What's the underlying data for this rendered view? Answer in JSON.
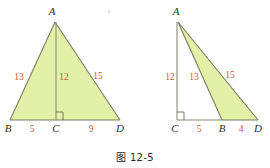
{
  "figure": {
    "caption": "图 12-5",
    "colors": {
      "shade_fill": "#e3f0a8",
      "edge_stroke": "#7d7a60",
      "length_text": "#d4562a",
      "vertex_text": "#2e2e2e",
      "background": "#ffffff"
    },
    "panels": [
      {
        "id": "left-panel",
        "name": "acute-triangle-with-altitude",
        "shaded_region": "ABD",
        "vertices": [
          {
            "label": "A",
            "name": "vertex-a"
          },
          {
            "label": "B",
            "name": "vertex-b"
          },
          {
            "label": "C",
            "name": "vertex-c"
          },
          {
            "label": "D",
            "name": "vertex-d"
          }
        ],
        "segments": [
          {
            "name": "segment-ab",
            "label": "13"
          },
          {
            "name": "segment-ac",
            "label": "12"
          },
          {
            "name": "segment-ad",
            "label": "15"
          },
          {
            "name": "segment-bc",
            "label": "5"
          },
          {
            "name": "segment-cd",
            "label": "9"
          }
        ],
        "right_angle_at": "C"
      },
      {
        "id": "right-panel",
        "name": "obtuse-triangle-with-external-altitude",
        "shaded_region": "ABD",
        "vertices": [
          {
            "label": "A",
            "name": "vertex-a"
          },
          {
            "label": "C",
            "name": "vertex-c"
          },
          {
            "label": "B",
            "name": "vertex-b"
          },
          {
            "label": "D",
            "name": "vertex-d"
          }
        ],
        "segments": [
          {
            "name": "segment-ac",
            "label": "12"
          },
          {
            "name": "segment-ab",
            "label": "13"
          },
          {
            "name": "segment-ad",
            "label": "15"
          },
          {
            "name": "segment-cb",
            "label": "5"
          },
          {
            "name": "segment-bd",
            "label": "4"
          }
        ],
        "right_angle_at": "C"
      }
    ]
  }
}
